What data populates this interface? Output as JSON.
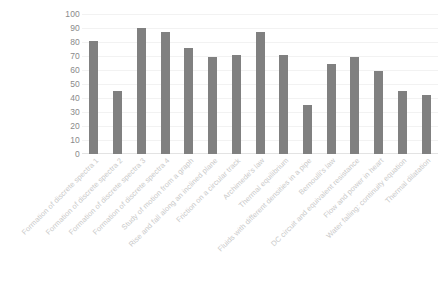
{
  "chart_data": {
    "type": "bar",
    "title": "",
    "subtitle": "",
    "xlabel": "",
    "ylabel": "",
    "ylim": [
      0,
      100
    ],
    "ytick_step": 10,
    "yticks": [
      100,
      90,
      80,
      70,
      60,
      50,
      40,
      30,
      20,
      10,
      0
    ],
    "grid": true,
    "grid_axis": "y",
    "legend": false,
    "legend_position": "none",
    "bar_color": "#808080",
    "gridline_color": "#f2f2f2",
    "tick_label_color": "#8a8a8a",
    "category_label_color": "#c9c9c9",
    "category_label_rotation": -45,
    "categories": [
      "Formation of discrete spectra 1",
      "Formation of discrete spectra 2",
      "Formation of discrete spectra 3",
      "Formation of discrete spectra 4",
      "Study of motion from a graph",
      "Rise and fall along an inclined plane",
      "Friction on a circular track",
      "Archimede's law",
      "Thermal equilibrium",
      "Fluids with different densities in a pipe",
      "Bernoulli's law",
      "DC circuit and equivalent resistance",
      "Flow and power in heart",
      "Water falling: continuity equation",
      "Thermal dilatation"
    ],
    "values": [
      81,
      45,
      90,
      87,
      76,
      69,
      71,
      87,
      71,
      35,
      64,
      69,
      59,
      45,
      42
    ]
  }
}
